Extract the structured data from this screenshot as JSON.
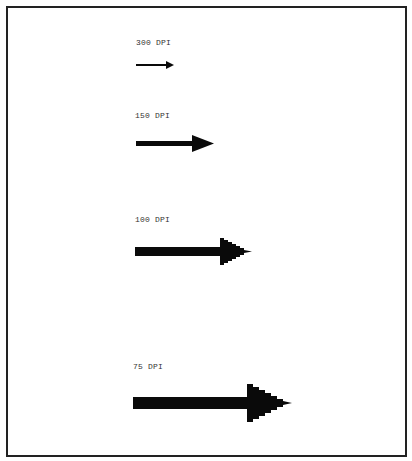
{
  "figure": {
    "panels": [
      {
        "label": "300 DPI",
        "label_pos": [
          136,
          38
        ],
        "arrow": {
          "x1": 136,
          "x2": 174,
          "y": 65,
          "shaft_h": 2,
          "head_w": 8,
          "head_h": 7,
          "steps": 1
        }
      },
      {
        "label": "150 DPI",
        "label_pos": [
          135,
          111
        ],
        "arrow": {
          "x1": 136,
          "x2": 214,
          "y": 143,
          "shaft_h": 5,
          "head_w": 22,
          "head_h": 16,
          "steps": 3
        }
      },
      {
        "label": "100 DPI",
        "label_pos": [
          135,
          215
        ],
        "arrow": {
          "x1": 135,
          "x2": 252,
          "y": 251,
          "shaft_h": 9,
          "head_w": 32,
          "head_h": 27,
          "steps": 5
        }
      },
      {
        "label": "75 DPI",
        "label_pos": [
          133,
          362
        ],
        "arrow": {
          "x1": 133,
          "x2": 292,
          "y": 403,
          "shaft_h": 12,
          "head_w": 45,
          "head_h": 38,
          "steps": 7
        }
      }
    ],
    "colors": {
      "ink": "#0a0a0a",
      "border": "#222222",
      "text": "#333333",
      "background": "#ffffff"
    }
  }
}
